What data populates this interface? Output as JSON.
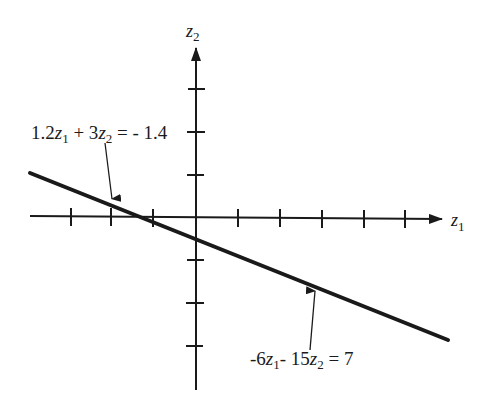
{
  "figure": {
    "axes": {
      "horizontal_label": "z",
      "horizontal_subscript": "1",
      "vertical_label": "z",
      "vertical_subscript": "2",
      "x_ticks": [
        -3,
        -2,
        -1,
        1,
        2,
        3,
        4,
        5
      ],
      "y_ticks": [
        3,
        2,
        1,
        -1,
        -2,
        -3
      ]
    },
    "line": {
      "description": "single straight line representing two equivalent equations",
      "slope": -0.4,
      "z2_intercept": -0.4667,
      "z1_intercept": -1.1667
    },
    "annotations": [
      {
        "id": "upper",
        "parts": [
          "1.2",
          "z",
          "1",
          " + 3",
          "z",
          "2",
          " = - 1.4"
        ],
        "text": "1.2z1 + 3z2 = - 1.4"
      },
      {
        "id": "lower",
        "parts": [
          "-6",
          "z",
          "1",
          "- 15",
          "z",
          "2",
          " = 7"
        ],
        "text": "-6z1- 15z2 = 7"
      }
    ],
    "colors": {
      "ink": "#1a1a1a",
      "background": "#ffffff"
    }
  }
}
